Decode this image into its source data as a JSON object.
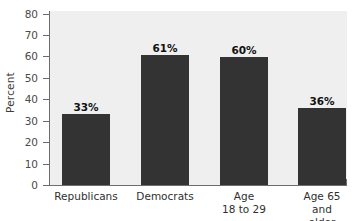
{
  "chart_data": {
    "type": "bar",
    "title": "",
    "subtitle": "",
    "xlabel": "",
    "ylabel": "Percent",
    "ylim": [
      0,
      80
    ],
    "ytick_step": 10,
    "yticks": [
      "80",
      "70",
      "60",
      "50",
      "40",
      "30",
      "20",
      "10",
      "0"
    ],
    "ytick_values": [
      80,
      70,
      60,
      50,
      40,
      30,
      20,
      10,
      0
    ],
    "grid": false,
    "legend": false,
    "legend_position": "none",
    "categories": [
      "Republicans",
      "Democrats",
      "Age\n18 to 29",
      "Age 65\nand older"
    ],
    "values": [
      33,
      61,
      60,
      36
    ],
    "data_labels": [
      "33%",
      "61%",
      "60%",
      "36%"
    ],
    "colors": {
      "bar_fill": "#333333",
      "plot_background": "#efefef",
      "page_background": "#ffffff",
      "axis_line": "#6d6d6d",
      "tick_text": "#4a4a4a",
      "label_text": "#121212"
    }
  }
}
